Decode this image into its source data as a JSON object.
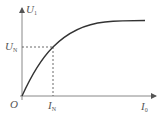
{
  "diagram": {
    "type": "characteristic-curve",
    "y_axis": {
      "label": "U",
      "subscript": "1"
    },
    "x_axis": {
      "label": "I",
      "subscript": "0"
    },
    "origin": {
      "label": "O"
    },
    "marker_y": {
      "label": "U",
      "subscript": "N"
    },
    "marker_x": {
      "label": "I",
      "subscript": "N"
    },
    "colors": {
      "axis": "#777777",
      "curve": "#333333",
      "dashed": "#444444",
      "text": "#555555"
    }
  }
}
